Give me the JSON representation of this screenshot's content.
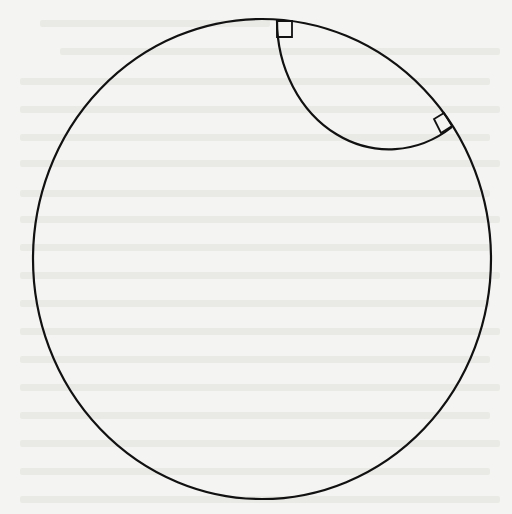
{
  "diagram": {
    "type": "poincare-disk-geodesic",
    "stroke_color": "#111111",
    "background_color": "#f4f4f2",
    "boundary_circle": {
      "cx": 262,
      "cy": 259,
      "rx": 229,
      "ry": 240
    },
    "geodesic_arc": {
      "start": {
        "x": 277,
        "y": 20
      },
      "end": {
        "x": 452,
        "y": 127
      },
      "rx": 112,
      "ry": 129
    },
    "right_angle_markers": [
      {
        "label": "top-right-angle",
        "points": [
          [
            277,
            21
          ],
          [
            292,
            21
          ],
          [
            292,
            37
          ],
          [
            277,
            37
          ]
        ]
      },
      {
        "label": "right-right-angle",
        "points": [
          [
            452,
            126
          ],
          [
            441,
            133
          ],
          [
            434,
            119
          ],
          [
            444,
            113
          ]
        ]
      }
    ],
    "labels": []
  }
}
